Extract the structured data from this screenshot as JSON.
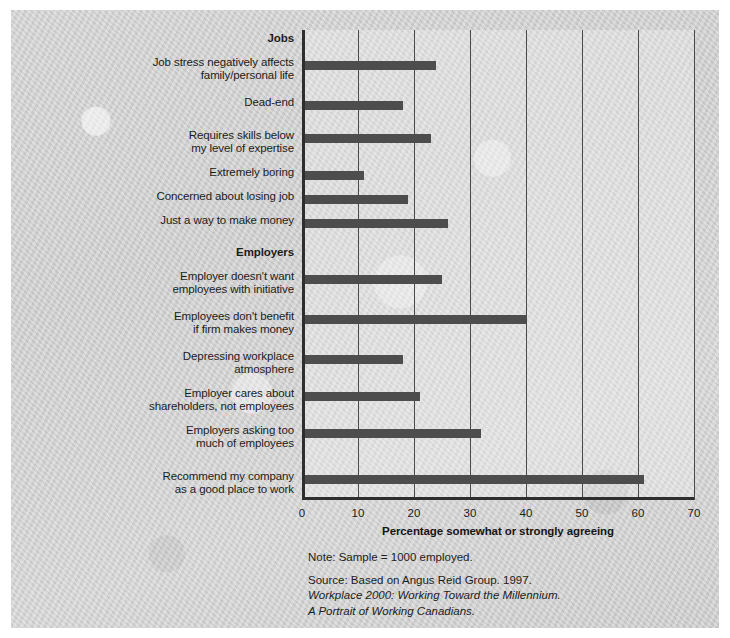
{
  "chart_data": {
    "type": "bar",
    "orientation": "horizontal",
    "title": "",
    "xlabel": "Percentage somewhat or strongly agreeing",
    "ylabel": "",
    "xlim": [
      0,
      70
    ],
    "xticks": [
      0,
      10,
      20,
      30,
      40,
      50,
      60,
      70
    ],
    "grid": true,
    "legend": null,
    "bar_color": "#4d4d4d",
    "groups": [
      {
        "name": "Jobs",
        "categories": [
          "Job stress negatively affects\nfamily/personal life",
          "Dead-end",
          "Requires skills below\nmy level of expertise",
          "Extremely boring",
          "Concerned about losing job",
          "Just a way to make money"
        ],
        "values": [
          24,
          18,
          23,
          11,
          19,
          26
        ]
      },
      {
        "name": "Employers",
        "categories": [
          "Employer doesn't want\nemployees with initiative",
          "Employees don't benefit\nif firm makes money",
          "Depressing workplace\natmosphere",
          "Employer cares about\nshareholders, not employees",
          "Employers asking too\nmuch of employees",
          "Recommend my company\nas a good place to work"
        ],
        "values": [
          25,
          40,
          18,
          21,
          32,
          61
        ]
      }
    ]
  },
  "axis": {
    "x_label": "Percentage somewhat or strongly agreeing",
    "ticks": [
      "0",
      "10",
      "20",
      "30",
      "40",
      "50",
      "60",
      "70"
    ]
  },
  "groups": {
    "jobs_heading": "Jobs",
    "employers_heading": "Employers"
  },
  "labels": {
    "job_stress": "Job stress negatively affects",
    "job_stress_2": "family/personal life",
    "dead_end": "Dead-end",
    "requires_skills": "Requires skills below",
    "requires_skills_2": "my level of expertise",
    "extremely_boring": "Extremely boring",
    "concerned_losing": "Concerned about losing job",
    "just_money": "Just a way to make money",
    "no_initiative": "Employer doesn't want",
    "no_initiative_2": "employees with initiative",
    "no_benefit": "Employees don't benefit",
    "no_benefit_2": "if firm makes money",
    "depressing": "Depressing workplace",
    "depressing_2": "atmosphere",
    "shareholders": "Employer cares about",
    "shareholders_2": "shareholders, not employees",
    "asking_too_much": "Employers asking too",
    "asking_too_much_2": "much of employees",
    "recommend": "Recommend my company",
    "recommend_2": "as a good place to work"
  },
  "footer": {
    "note": "Note: Sample = 1000 employed.",
    "source": "Source: Based on Angus Reid Group. 1997.",
    "source_title": "Workplace 2000: Working Toward the Millennium.",
    "source_subtitle": "A Portrait of Working Canadians."
  }
}
